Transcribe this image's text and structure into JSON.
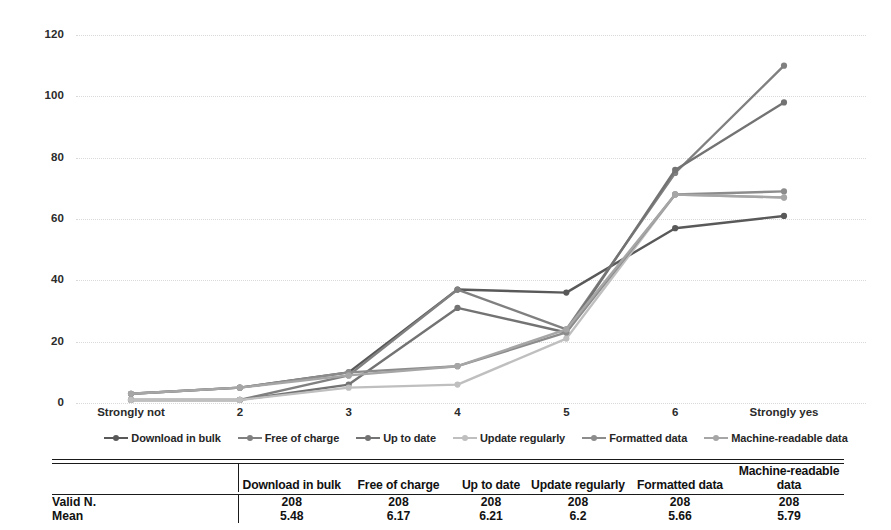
{
  "chart_data": {
    "type": "line",
    "title": "",
    "xlabel": "",
    "ylabel": "",
    "categories": [
      "Strongly not",
      "2",
      "3",
      "4",
      "5",
      "6",
      "Strongly yes"
    ],
    "ylim": [
      0,
      120
    ],
    "y_ticks": [
      0,
      20,
      40,
      60,
      80,
      100,
      120
    ],
    "grid": true,
    "legend_position": "bottom",
    "series": [
      {
        "name": "Download in bulk",
        "color": "#595959",
        "values": [
          3,
          5,
          10,
          37,
          36,
          57,
          61
        ]
      },
      {
        "name": "Free of charge",
        "color": "#808080",
        "values": [
          1,
          1,
          9,
          37,
          24,
          75,
          110
        ]
      },
      {
        "name": "Up to date",
        "color": "#737373",
        "values": [
          1,
          1,
          6,
          31,
          23,
          76,
          98
        ]
      },
      {
        "name": "Update regularly",
        "color": "#bfbfbf",
        "values": [
          1,
          1,
          5,
          6,
          21,
          68,
          67
        ]
      },
      {
        "name": "Formatted data",
        "color": "#8c8c8c",
        "values": [
          3,
          5,
          10,
          12,
          23,
          68,
          69
        ]
      },
      {
        "name": "Machine-readable data",
        "color": "#a6a6a6",
        "values": [
          3,
          5,
          9,
          12,
          24,
          68,
          67
        ]
      }
    ]
  },
  "y_axis": {
    "ticks": [
      "120",
      "100",
      "80",
      "60",
      "40",
      "20",
      "0"
    ]
  },
  "x_axis": {
    "ticks": [
      "Strongly not",
      "2",
      "3",
      "4",
      "5",
      "6",
      "Strongly yes"
    ]
  },
  "legend": {
    "items": [
      {
        "label": "Download in bulk"
      },
      {
        "label": "Free of charge"
      },
      {
        "label": "Up to date"
      },
      {
        "label": "Update regularly"
      },
      {
        "label": "Formatted data"
      },
      {
        "label": "Machine-readable data"
      }
    ]
  },
  "table": {
    "corner_label": "",
    "columns": [
      "Download in bulk",
      "Free of charge",
      "Up to date",
      "Update regularly",
      "Formatted data",
      "Machine-readable data"
    ],
    "rows": [
      {
        "label": "Valid N.",
        "values": [
          "208",
          "208",
          "208",
          "208",
          "208",
          "208"
        ]
      },
      {
        "label": "Mean",
        "values": [
          "5.48",
          "6.17",
          "6.21",
          "6.2",
          "5.66",
          "5.79"
        ]
      }
    ]
  }
}
